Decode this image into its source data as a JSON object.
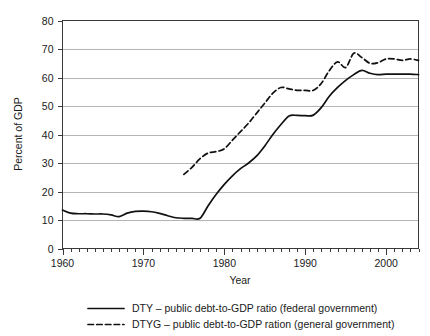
{
  "chart_data": {
    "type": "line",
    "title": "",
    "xlabel": "Year",
    "ylabel": "Percent of GDP",
    "xlim": [
      1960,
      2004
    ],
    "ylim": [
      0,
      80
    ],
    "ytick_step": 10,
    "xtick_step": 10,
    "xminor_step": 1,
    "grid": "horizontal",
    "legend_position": "bottom",
    "ytick_labels": [
      "0",
      "10",
      "20",
      "30",
      "40",
      "50",
      "60",
      "70",
      "80"
    ],
    "ytick_values": [
      0,
      10,
      20,
      30,
      40,
      50,
      60,
      70,
      80
    ],
    "xtick_labels": [
      "1960",
      "1970",
      "1980",
      "1990",
      "2000"
    ],
    "xtick_values": [
      1960,
      1970,
      1980,
      1990,
      2000
    ],
    "series": [
      {
        "name": "DTY",
        "legend_label": "DTY – public debt-to-GDP ratio (federal government)",
        "style": "solid",
        "color": "#111111",
        "x": [
          1960,
          1961,
          1962,
          1963,
          1964,
          1965,
          1966,
          1967,
          1968,
          1969,
          1970,
          1971,
          1972,
          1973,
          1974,
          1975,
          1976,
          1977,
          1978,
          1979,
          1980,
          1981,
          1982,
          1983,
          1984,
          1985,
          1986,
          1987,
          1988,
          1989,
          1990,
          1991,
          1992,
          1993,
          1994,
          1995,
          1996,
          1997,
          1998,
          1999,
          2000,
          2001,
          2002,
          2003,
          2004
        ],
        "y": [
          13.5,
          12.4,
          12.2,
          12.2,
          12.1,
          12.1,
          11.8,
          11.2,
          12.4,
          13.0,
          13.1,
          12.9,
          12.3,
          11.5,
          10.8,
          10.6,
          10.6,
          10.6,
          15.0,
          19.0,
          22.5,
          25.5,
          28.0,
          30.0,
          32.5,
          36.0,
          40.0,
          43.5,
          46.5,
          46.7,
          46.6,
          46.8,
          49.5,
          53.5,
          56.5,
          59.0,
          61.0,
          62.5,
          61.5,
          61.0,
          61.2,
          61.2,
          61.2,
          61.2,
          61.0
        ]
      },
      {
        "name": "DTYG",
        "legend_label": "DTYG – public debt-to-GDP ration (general government)",
        "style": "dashed",
        "color": "#111111",
        "x": [
          1975,
          1976,
          1977,
          1978,
          1979,
          1980,
          1981,
          1982,
          1983,
          1984,
          1985,
          1986,
          1987,
          1988,
          1989,
          1990,
          1991,
          1992,
          1993,
          1994,
          1995,
          1996,
          1997,
          1998,
          1999,
          2000,
          2001,
          2002,
          2003,
          2004
        ],
        "y": [
          26.0,
          28.5,
          31.5,
          33.5,
          34.0,
          35.0,
          38.0,
          41.0,
          44.0,
          47.5,
          51.0,
          54.5,
          56.5,
          56.0,
          55.5,
          55.5,
          55.5,
          58.0,
          62.5,
          65.5,
          63.5,
          68.5,
          67.0,
          65.0,
          65.2,
          66.5,
          66.5,
          66.0,
          66.5,
          66.0
        ]
      }
    ]
  },
  "legend": {
    "entries": [
      {
        "label": "DTY – public debt-to-GDP ratio (federal government)",
        "style": "solid"
      },
      {
        "label": "DTYG – public debt-to-GDP ration (general government)",
        "style": "dashed"
      }
    ]
  }
}
